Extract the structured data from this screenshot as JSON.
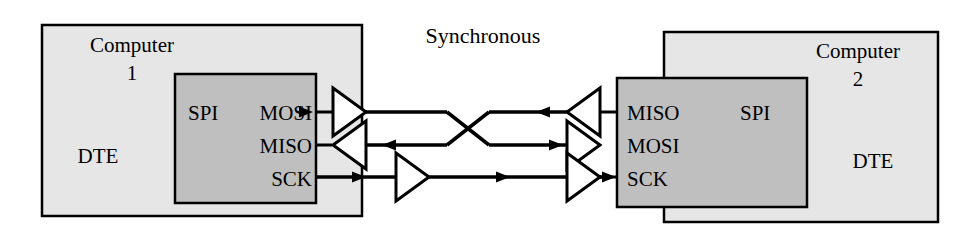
{
  "diagram": {
    "title": "Synchronous",
    "colors": {
      "outer_box_fill": "#e6e6e6",
      "inner_box_fill": "#bfbfbf",
      "stroke": "#000000",
      "background": "#ffffff",
      "buffer_fill": "#ffffff"
    },
    "left_computer": {
      "name_line1": "Computer",
      "name_line2": "1",
      "terminal_type": "DTE",
      "interface_label": "SPI",
      "pins": [
        {
          "label": "MOSI",
          "direction": "out"
        },
        {
          "label": "MISO",
          "direction": "in"
        },
        {
          "label": "SCK",
          "direction": "out"
        }
      ]
    },
    "right_computer": {
      "name_line1": "Computer",
      "name_line2": "2",
      "terminal_type": "DTE",
      "interface_label": "SPI",
      "pins": [
        {
          "label": "MISO",
          "direction": "out"
        },
        {
          "label": "MOSI",
          "direction": "in"
        },
        {
          "label": "SCK",
          "direction": "in"
        }
      ]
    },
    "links": [
      {
        "name": "mosi-to-miso",
        "from": "MOSI",
        "to": "MISO",
        "flow": "left-to-right",
        "crossed": true
      },
      {
        "name": "miso-from-mosi",
        "from": "MOSI",
        "to": "MISO",
        "flow": "right-to-left",
        "crossed": true
      },
      {
        "name": "sck-link",
        "from": "SCK",
        "to": "SCK",
        "flow": "left-to-right",
        "crossed": false
      }
    ],
    "buffers": [
      {
        "name": "left-mosi-driver",
        "direction": "right"
      },
      {
        "name": "left-miso-receiver",
        "direction": "left"
      },
      {
        "name": "left-sck-driver",
        "direction": "right"
      },
      {
        "name": "right-miso-driver",
        "direction": "left"
      },
      {
        "name": "right-mosi-receiver",
        "direction": "right"
      },
      {
        "name": "right-sck-receiver",
        "direction": "right"
      }
    ]
  }
}
